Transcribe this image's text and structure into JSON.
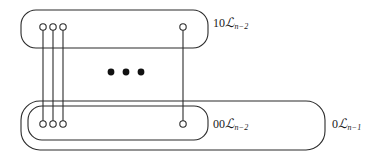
{
  "figure": {
    "type": "nested-box-node-diagram",
    "background_color": "#ffffff",
    "stroke_color": "#2b2b2b",
    "labels": {
      "top_box": {
        "prefix": "10",
        "symbol": "L",
        "subscript": "n−2",
        "full_text": "10ℒn−2"
      },
      "inner_bottom_box": {
        "prefix": "00",
        "symbol": "L",
        "subscript": "n−2",
        "full_text": "00ℒn−2"
      },
      "outer_bottom_box": {
        "prefix": "0",
        "symbol": "L",
        "subscript": "n−1",
        "full_text": "0ℒn−1"
      }
    },
    "boxes": [
      {
        "id": "top-box",
        "label_ref": "top_box",
        "x": 21,
        "y": 10,
        "width": 187,
        "height": 38,
        "corner_radius": 15
      },
      {
        "id": "outer-bottom-box",
        "label_ref": "outer_bottom_box",
        "x": 21,
        "y": 101,
        "width": 304,
        "height": 49,
        "corner_radius": 19
      },
      {
        "id": "inner-bottom-box",
        "label_ref": "inner_bottom_box",
        "x": 28,
        "y": 106,
        "width": 180,
        "height": 34,
        "corner_radius": 14
      }
    ],
    "nodes_top": [
      {
        "id": "top-node-1",
        "cx": 43,
        "cy": 27,
        "r": 3.2
      },
      {
        "id": "top-node-2",
        "cx": 53,
        "cy": 27,
        "r": 3.2
      },
      {
        "id": "top-node-3",
        "cx": 63,
        "cy": 27,
        "r": 3.2
      },
      {
        "id": "top-node-4",
        "cx": 183,
        "cy": 27,
        "r": 3.2
      }
    ],
    "nodes_bottom": [
      {
        "id": "bottom-node-1",
        "cx": 43,
        "cy": 124,
        "r": 3.2
      },
      {
        "id": "bottom-node-2",
        "cx": 53,
        "cy": 124,
        "r": 3.2
      },
      {
        "id": "bottom-node-3",
        "cx": 63,
        "cy": 124,
        "r": 3.2
      },
      {
        "id": "bottom-node-4",
        "cx": 183,
        "cy": 124,
        "r": 3.2
      }
    ],
    "edges": [
      {
        "id": "edge-1",
        "x": 43,
        "y1": 30,
        "y2": 121
      },
      {
        "id": "edge-2",
        "x": 53,
        "y1": 30,
        "y2": 121
      },
      {
        "id": "edge-3",
        "x": 63,
        "y1": 30,
        "y2": 121
      },
      {
        "id": "edge-4",
        "x": 183,
        "y1": 30,
        "y2": 121
      }
    ],
    "ellipsis_dots": [
      {
        "id": "ellipsis-dot-1",
        "cx": 111,
        "cy": 72,
        "r": 3.4
      },
      {
        "id": "ellipsis-dot-2",
        "cx": 126,
        "cy": 72,
        "r": 3.4
      },
      {
        "id": "ellipsis-dot-3",
        "cx": 141,
        "cy": 72,
        "r": 3.4
      }
    ]
  }
}
